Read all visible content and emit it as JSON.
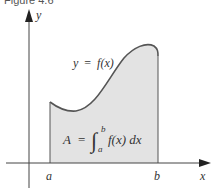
{
  "caption": "Figure 4.6",
  "axes": {
    "x_label": "x",
    "y_label": "y"
  },
  "bounds": {
    "a": "a",
    "b": "b"
  },
  "curve_label": {
    "lhs": "y",
    "eq": "=",
    "rhs": "f(x)"
  },
  "area_formula": {
    "lhs": "A",
    "eq": "=",
    "integral": "∫",
    "upper": "b",
    "lower": "a",
    "integrand": "f(x) dx"
  },
  "colors": {
    "fill": "#e3e3e3",
    "curve": "#555555",
    "axis": "#444444"
  }
}
